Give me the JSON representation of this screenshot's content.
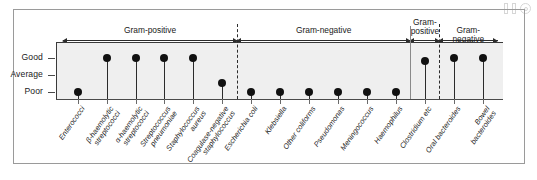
{
  "chart_data": {
    "type": "scatter",
    "title": "",
    "xlabel": "",
    "ylabel": "",
    "ylim": [
      0,
      3
    ],
    "grid": false,
    "legend": null,
    "y_tick_labels": [
      "Good",
      "Average",
      "Poor"
    ],
    "y_tick_values": [
      3,
      2,
      1
    ],
    "categories": [
      "Enterococci",
      "β-haemolytic streptococci",
      "α-haemolytic streptococci",
      "Streptococcus pneumoniae",
      "Staphylococcus aureus",
      "Coagulase-negative staphylococcus",
      "Escherichia coli",
      "Klebsiella",
      "Other coliforms",
      "Pseudomonas",
      "Meningococcus",
      "Haemophilus",
      "Clostridium etc",
      "Oral bacteroides",
      "Bowel bacteroides"
    ],
    "values": [
      1,
      3,
      3,
      3,
      3,
      1.55,
      1,
      1,
      1,
      1,
      1,
      1,
      2.8,
      3,
      3
    ],
    "value_labels": [
      "Poor",
      "Good",
      "Good",
      "Good",
      "Good",
      "Between Poor and Average",
      "Poor",
      "Poor",
      "Poor",
      "Poor",
      "Poor",
      "Poor",
      "Just below Good",
      "Good",
      "Good"
    ],
    "groups": [
      {
        "label": "Gram-positive",
        "from_index": 0,
        "to_index": 5
      },
      {
        "label": "Gram-negative",
        "from_index": 6,
        "to_index": 11
      },
      {
        "label": "Gram-\npositive",
        "from_index": 12,
        "to_index": 12
      },
      {
        "label": "Gram-negative",
        "from_index": 13,
        "to_index": 14
      }
    ],
    "dividers": [
      {
        "style": "dashed",
        "after_index": 5
      },
      {
        "style": "solid",
        "after_index": 11
      },
      {
        "style": "dashed",
        "after_index": 12
      }
    ],
    "colors": {
      "marker": "#111111",
      "stem": "#2b2b2b",
      "plot_background": "#efefef",
      "axis": "#3a3a3a",
      "frame": "#9a9a9a",
      "page_background": "#ffffff",
      "text": "#1a1a1a"
    }
  },
  "corner_icons": [
    {
      "name": "bar-glyph-1"
    },
    {
      "name": "bar-glyph-2"
    },
    {
      "name": "target-glyph"
    }
  ]
}
